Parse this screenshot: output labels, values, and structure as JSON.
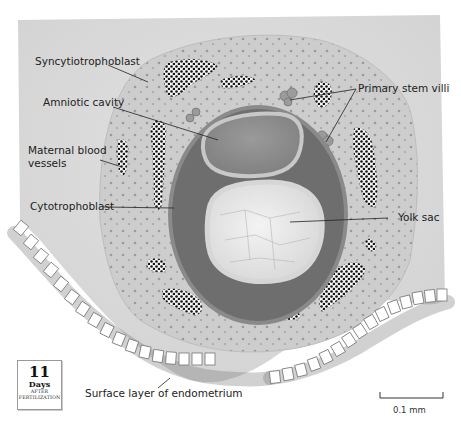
{
  "figure": {
    "type": "anatomical-illustration",
    "labels": {
      "syncytiotrophoblast": "Syncytiotrophoblast",
      "amniotic_cavity": "Amniotic cavity",
      "maternal_blood_vessels_line1": "Maternal blood",
      "maternal_blood_vessels_line2": "vessels",
      "cytotrophoblast": "Cytotrophoblast",
      "primary_stem_villi": "Primary stem villi",
      "yolk_sac": "Yolk sac",
      "surface_layer": "Surface layer of endometrium"
    },
    "day_badge": {
      "number": "11",
      "unit": "Days",
      "line1": "AFTER",
      "line2": "FERTILIZATION"
    },
    "scale_bar": {
      "label": "0.1 mm"
    },
    "colors": {
      "background_tissue": "#dcdcdc",
      "syncytio": "#c9c9c9",
      "cyto_ring": "#6e6e6e",
      "amniotic": "#8c8c8c",
      "yolk": "#e9e9e9",
      "cell_border": "#7a7a7a",
      "blood_dots": "#1a1a1a"
    }
  }
}
